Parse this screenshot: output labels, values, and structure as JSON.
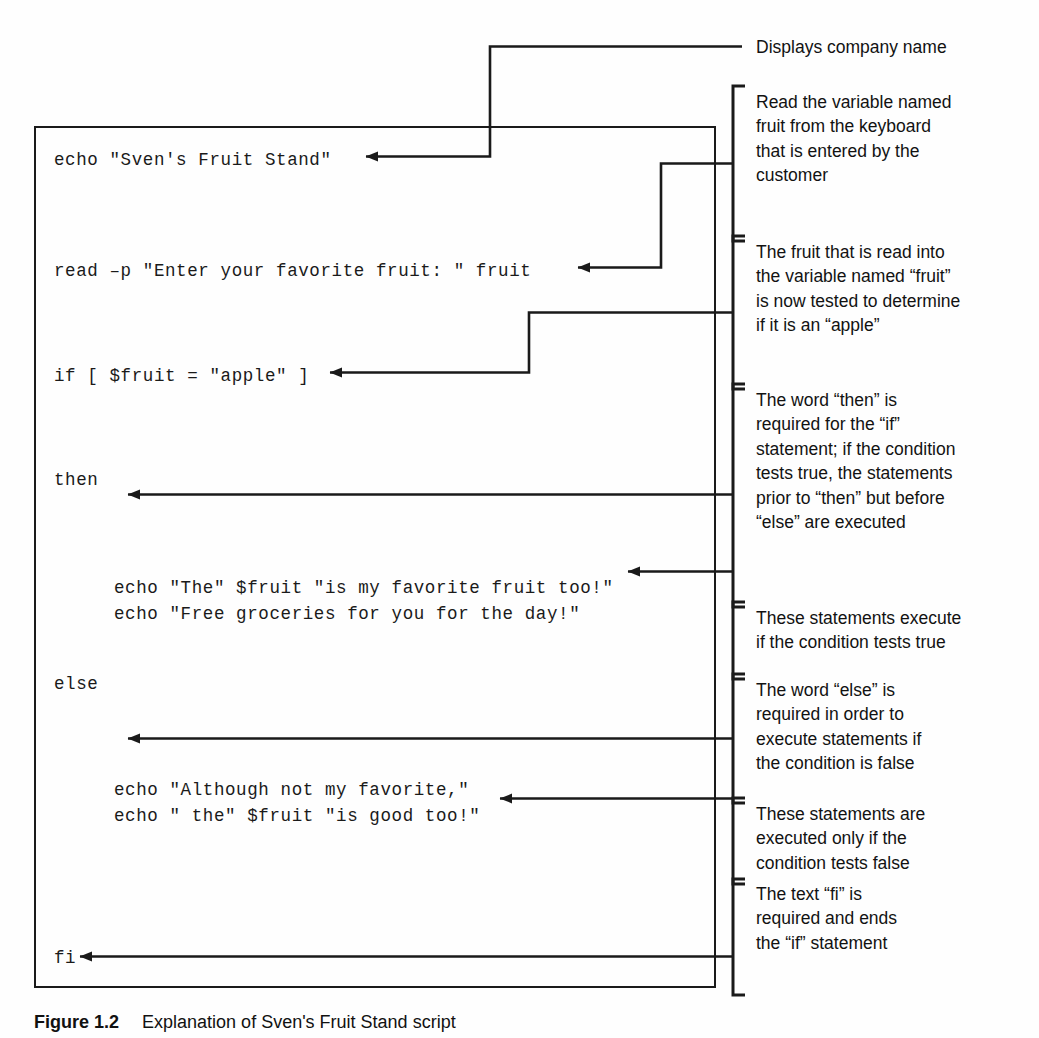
{
  "figure": {
    "caption_label": "Figure 1.2",
    "caption_text": "Explanation of Sven's Fruit Stand script"
  },
  "code": {
    "language": "bash",
    "lines": [
      {
        "id": "line-echo-title",
        "text": "echo \"Sven's Fruit Stand\""
      },
      {
        "id": "line-read-fruit",
        "text": "read –p \"Enter your favorite fruit: \" fruit"
      },
      {
        "id": "line-if-test",
        "text": "if [ $fruit = \"apple\" ]"
      },
      {
        "id": "line-then",
        "text": "then"
      },
      {
        "id": "line-echo-true-1",
        "text": "echo \"The\" $fruit \"is my favorite fruit too!\""
      },
      {
        "id": "line-echo-true-2",
        "text": "echo \"Free groceries for you for the day!\""
      },
      {
        "id": "line-else",
        "text": "else"
      },
      {
        "id": "line-echo-false-1",
        "text": "echo \"Although not my favorite,\""
      },
      {
        "id": "line-echo-false-2",
        "text": "echo \" the\" $fruit \"is good too!\""
      },
      {
        "id": "line-fi",
        "text": "fi"
      }
    ]
  },
  "annotations": [
    {
      "id": "annotation-displays-company-name",
      "text": "Displays company name",
      "has_bracket": false
    },
    {
      "id": "annotation-read-variable",
      "text": "Read the variable named\nfruit from the keyboard\nthat is entered by the\ncustomer",
      "has_bracket": true
    },
    {
      "id": "annotation-fruit-tested",
      "text": "The fruit that is read into\nthe variable named “fruit”\nis now tested to determine\nif it is an “apple”",
      "has_bracket": true
    },
    {
      "id": "annotation-word-then",
      "text": "The word “then” is\nrequired for the “if”\nstatement; if the condition\ntests true, the statements\nprior to “then” but before\n“else” are executed",
      "has_bracket": true
    },
    {
      "id": "annotation-statements-true",
      "text": "These statements execute\nif the condition tests true",
      "has_bracket": true
    },
    {
      "id": "annotation-word-else",
      "text": "The word “else” is\nrequired in order to\nexecute statements if\nthe condition is false",
      "has_bracket": true
    },
    {
      "id": "annotation-statements-false",
      "text": "These statements are\nexecuted only if the\ncondition tests false",
      "has_bracket": true
    },
    {
      "id": "annotation-text-fi",
      "text": "The text “fi” is\nrequired and ends\nthe “if” statement",
      "has_bracket": true
    }
  ],
  "colors": {
    "ink": "#1a1a1a",
    "paper": "#fefefe"
  }
}
